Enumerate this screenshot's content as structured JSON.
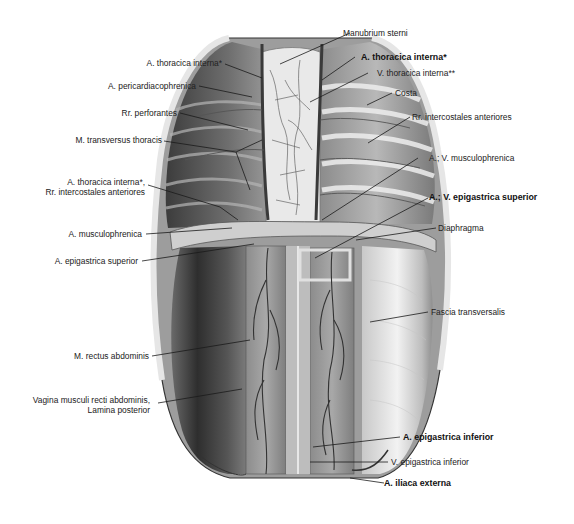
{
  "figure": {
    "colors": {
      "background": "#ffffff",
      "tissue_dark": "#3a3a3a",
      "tissue_mid": "#8a8a8a",
      "tissue_light": "#d8d8d8",
      "vessel": "#4a4a4a",
      "leader_line": "#1a1a1a"
    },
    "labels": {
      "manubrium_sterni": "Manubrium sterni",
      "a_thoracica_interna_left": "A. thoracica interna*",
      "a_thoracica_interna_right": "A. thoracica interna*",
      "v_thoracica_interna": "V. thoracica interna**",
      "a_pericardiacophrenica": "A. pericardiacophrenica",
      "costa": "Costa",
      "rr_perforantes": "Rr. perforantes",
      "rr_intercostales_anteriores_right": "Rr. intercostales anteriores",
      "m_transversus_thoracis": "M. transversus thoracis",
      "a_v_musculophrenica": "A.; V. musculophrenica",
      "a_thoracica_interna_rr_line1": "A. thoracica interna*,",
      "a_thoracica_interna_rr_line2": "Rr. intercostales anteriores",
      "a_v_epigastrica_superior": "A.; V. epigastrica superior",
      "a_musculophrenica": "A. musculophrenica",
      "diaphragma": "Diaphragma",
      "a_epigastrica_superior": "A. epigastrica superior",
      "fascia_transversalis": "Fascia transversalis",
      "m_rectus_abdominis": "M. rectus abdominis",
      "vagina_line1": "Vagina musculi recti abdominis,",
      "vagina_line2": "Lamina posterior",
      "a_epigastrica_inferior": "A. epigastrica inferior",
      "v_epigastrica_inferior": "V. epigastrica inferior",
      "a_iliaca_externa": "A. iliaca externa"
    }
  }
}
